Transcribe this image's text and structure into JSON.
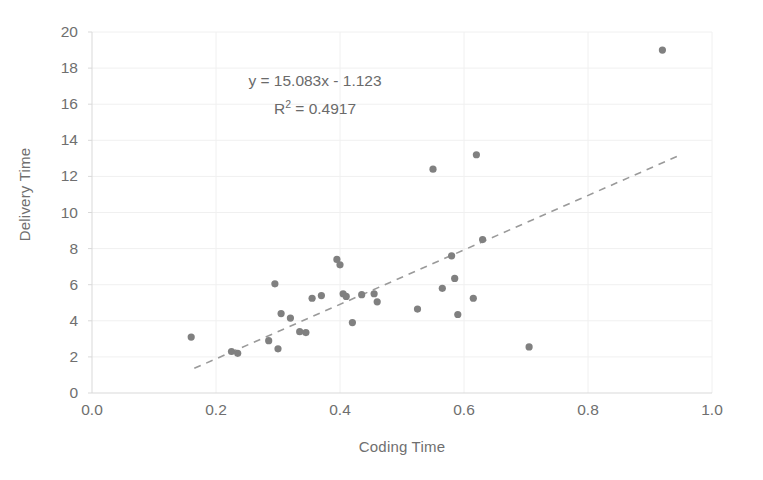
{
  "chart_data": {
    "type": "scatter",
    "title": "",
    "xlabel": "Coding Time",
    "ylabel": "Delivery Time",
    "xlim": [
      0.0,
      1.0
    ],
    "ylim": [
      0,
      20
    ],
    "xticks": [
      "0.0",
      "0.2",
      "0.4",
      "0.6",
      "0.8",
      "1.0"
    ],
    "xtick_values": [
      0.0,
      0.2,
      0.4,
      0.6,
      0.8,
      1.0
    ],
    "yticks": [
      "0",
      "2",
      "4",
      "6",
      "8",
      "10",
      "12",
      "14",
      "16",
      "18",
      "20"
    ],
    "ytick_values": [
      0,
      2,
      4,
      6,
      8,
      10,
      12,
      14,
      16,
      18,
      20
    ],
    "grid": true,
    "legend": "none",
    "marker_color": "#808080",
    "trendline_color": "#9a9a9a",
    "text_color": "#6f6f6f",
    "annotations": {
      "equation": "y = 15.083x - 1.123",
      "r_squared_prefix": "R",
      "r_squared_exponent": "2",
      "r_squared_value": " = 0.4917",
      "r_squared_full": "R² = 0.4917"
    },
    "trendline": {
      "slope": 15.083,
      "intercept": -1.123,
      "r_squared": 0.4917,
      "style": "dashed",
      "x_start": 0.165,
      "x_end": 0.945
    },
    "points": [
      {
        "x": 0.16,
        "y": 3.1
      },
      {
        "x": 0.225,
        "y": 2.3
      },
      {
        "x": 0.235,
        "y": 2.2
      },
      {
        "x": 0.285,
        "y": 2.9
      },
      {
        "x": 0.295,
        "y": 6.05
      },
      {
        "x": 0.3,
        "y": 2.45
      },
      {
        "x": 0.305,
        "y": 4.4
      },
      {
        "x": 0.32,
        "y": 4.15
      },
      {
        "x": 0.335,
        "y": 3.4
      },
      {
        "x": 0.345,
        "y": 3.35
      },
      {
        "x": 0.355,
        "y": 5.25
      },
      {
        "x": 0.37,
        "y": 5.4
      },
      {
        "x": 0.395,
        "y": 7.4
      },
      {
        "x": 0.4,
        "y": 7.1
      },
      {
        "x": 0.405,
        "y": 5.5
      },
      {
        "x": 0.41,
        "y": 5.35
      },
      {
        "x": 0.42,
        "y": 3.9
      },
      {
        "x": 0.435,
        "y": 5.45
      },
      {
        "x": 0.455,
        "y": 5.5
      },
      {
        "x": 0.46,
        "y": 5.05
      },
      {
        "x": 0.525,
        "y": 4.65
      },
      {
        "x": 0.55,
        "y": 12.4
      },
      {
        "x": 0.565,
        "y": 5.8
      },
      {
        "x": 0.58,
        "y": 7.6
      },
      {
        "x": 0.585,
        "y": 6.35
      },
      {
        "x": 0.59,
        "y": 4.35
      },
      {
        "x": 0.615,
        "y": 5.25
      },
      {
        "x": 0.62,
        "y": 13.2
      },
      {
        "x": 0.63,
        "y": 8.5
      },
      {
        "x": 0.705,
        "y": 2.55
      },
      {
        "x": 0.92,
        "y": 19.0
      }
    ]
  }
}
